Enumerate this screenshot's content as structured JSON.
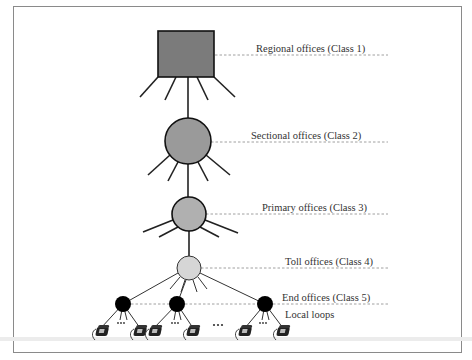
{
  "diagram": {
    "type": "telephone-network-hierarchy",
    "levels": [
      {
        "id": "class1",
        "label": "Regional offices (Class 1)",
        "shape": "square",
        "color": "#7b7b7b"
      },
      {
        "id": "class2",
        "label": "Sectional  offices (Class 2)",
        "shape": "circle",
        "color": "#9a9a9a"
      },
      {
        "id": "class3",
        "label": "Primary offices (Class 3)",
        "shape": "circle",
        "color": "#b0b0b0"
      },
      {
        "id": "class4",
        "label": "Toll offices (Class 4)",
        "shape": "circle",
        "color": "#d6d6d6"
      },
      {
        "id": "class5",
        "label": "End offices (Class 5)",
        "shape": "circle",
        "color": "#000000"
      }
    ],
    "local_loops_label": "Local loops",
    "ellipsis": "…"
  }
}
